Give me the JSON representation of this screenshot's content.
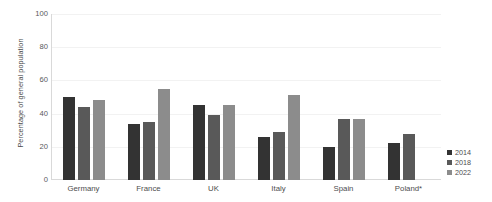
{
  "chart_data": {
    "type": "bar",
    "title": "",
    "subtitle": "",
    "xlabel": "",
    "ylabel": "Percentage of general population",
    "ylim": [
      0,
      100
    ],
    "yticks": [
      0,
      20,
      40,
      60,
      80,
      100
    ],
    "ytick_labels": [
      "0",
      "20",
      "40",
      "60",
      "80",
      "100"
    ],
    "grid": true,
    "grid_axis": "y",
    "legend_position": "right",
    "categories": [
      "Germany",
      "France",
      "UK",
      "Italy",
      "Spain",
      "Poland*"
    ],
    "series": [
      {
        "name": "2014",
        "color": "#333333",
        "values": [
          50,
          34,
          45,
          26,
          20,
          22
        ]
      },
      {
        "name": "2018",
        "color": "#595959",
        "values": [
          44,
          35,
          39,
          29,
          37,
          28
        ]
      },
      {
        "name": "2022",
        "color": "#8c8c8c",
        "values": [
          48,
          55,
          45,
          51,
          37,
          null
        ]
      }
    ]
  },
  "legend": {
    "items": [
      {
        "label": "2014",
        "color": "#333333"
      },
      {
        "label": "2018",
        "color": "#595959"
      },
      {
        "label": "2022",
        "color": "#8c8c8c"
      }
    ]
  },
  "colors": {
    "background": "#ffffff",
    "gridline": "#f2f2f2",
    "axis": "#d9d9d9",
    "text": "#4d4d4d",
    "tick_text": "#595959"
  }
}
